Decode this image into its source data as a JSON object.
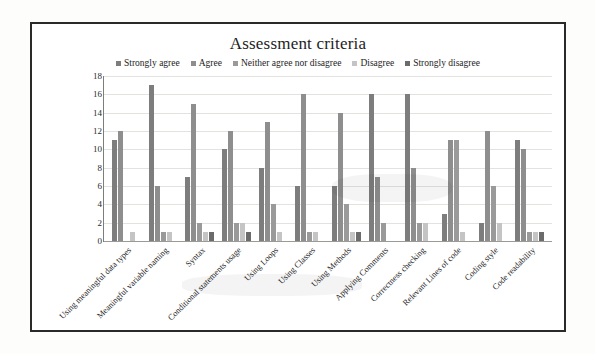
{
  "chart_data": {
    "type": "bar",
    "title": "Assessment criteria",
    "xlabel": "",
    "ylabel": "",
    "ylim": [
      0,
      18
    ],
    "ytick_step": 2,
    "yticks": [
      18,
      16,
      14,
      12,
      10,
      8,
      6,
      4,
      2,
      0
    ],
    "grid": true,
    "legend_position": "top-center",
    "orientation": "vertical",
    "categories": [
      "Using meaningful data types",
      "Meaningful variable naming",
      "Syntax",
      "Conditional statements usage",
      "Using Loops",
      "Using Classes",
      "Using Methods",
      "Applying Comments",
      "Correctness checking",
      "Relevant Lines of code",
      "Coding style",
      "Code readability"
    ],
    "series": [
      {
        "name": "Strongly agree",
        "color": "#7d7d7d",
        "values": [
          11,
          17,
          7,
          10,
          8,
          6,
          6,
          16,
          16,
          3,
          2,
          11
        ]
      },
      {
        "name": "Agree",
        "color": "#8e8e8e",
        "values": [
          12,
          6,
          15,
          12,
          13,
          16,
          14,
          7,
          8,
          11,
          12,
          10
        ]
      },
      {
        "name": "Neither agree nor disagree",
        "color": "#9a9a9a",
        "values": [
          0,
          1,
          2,
          2,
          4,
          1,
          4,
          2,
          2,
          11,
          6,
          1
        ]
      },
      {
        "name": "Disagree",
        "color": "#c4c4c4",
        "values": [
          1,
          1,
          1,
          2,
          1,
          1,
          1,
          0,
          2,
          1,
          2,
          1
        ]
      },
      {
        "name": "Strongly disagree",
        "color": "#6b6b6b",
        "values": [
          0,
          0,
          1,
          1,
          0,
          0,
          1,
          0,
          0,
          0,
          0,
          1
        ]
      }
    ]
  },
  "legend": {
    "items": [
      {
        "label": "Strongly agree",
        "color": "#7d7d7d"
      },
      {
        "label": "Agree",
        "color": "#8e8e8e"
      },
      {
        "label": "Neither agree nor disagree",
        "color": "#9a9a9a"
      },
      {
        "label": "Disagree",
        "color": "#c4c4c4"
      },
      {
        "label": "Strongly disagree",
        "color": "#6b6b6b"
      }
    ]
  }
}
